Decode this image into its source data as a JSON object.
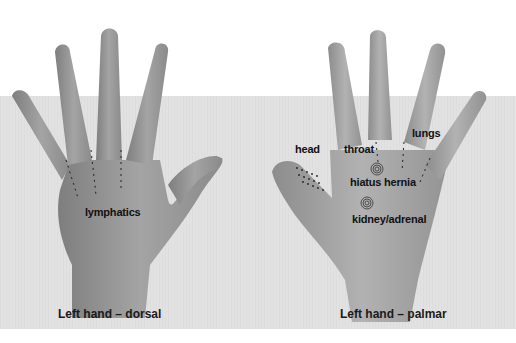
{
  "figure": {
    "left_hand": {
      "caption": "Left hand – dorsal",
      "labels": {
        "lymphatics": "lymphatics"
      }
    },
    "right_hand": {
      "caption": "Left hand – palmar",
      "labels": {
        "head": "head",
        "throat": "throat",
        "lungs": "lungs",
        "hiatus_hernia": "hiatus hernia",
        "kidney_line1": "kidney/adrenal",
        "kidney_line2": "glands"
      }
    },
    "colors": {
      "background": "#ffffff",
      "band": "#e2e2e2",
      "skin": "#9a9a9a",
      "text": "#111111"
    }
  }
}
